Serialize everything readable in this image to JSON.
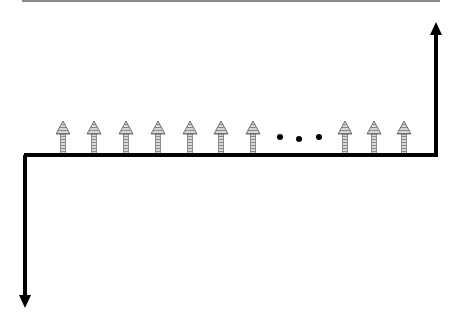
{
  "diagram": {
    "type": "cash-flow-diagram",
    "colors": {
      "line": "#000000",
      "small_arrow_fill": "#bdbdbd",
      "small_arrow_stroke": "#555555",
      "top_rule": "#8a8a8a"
    },
    "baseline": {
      "x1": 24,
      "x2": 437,
      "y": 155
    },
    "outflow_arrow": {
      "direction": "down",
      "x": 25,
      "y_start": 155,
      "y_end": 308
    },
    "inflow_arrow_large": {
      "direction": "up",
      "x": 436,
      "y_start": 155,
      "y_end": 22
    },
    "small_up_arrows": [
      {
        "x": 63
      },
      {
        "x": 94
      },
      {
        "x": 126
      },
      {
        "x": 158
      },
      {
        "x": 190
      },
      {
        "x": 221
      },
      {
        "x": 253
      },
      {
        "x": 345
      },
      {
        "x": 374
      },
      {
        "x": 404
      }
    ],
    "ellipsis_dots": [
      {
        "x": 280,
        "y": 137
      },
      {
        "x": 299,
        "y": 139
      },
      {
        "x": 319,
        "y": 137
      }
    ]
  }
}
